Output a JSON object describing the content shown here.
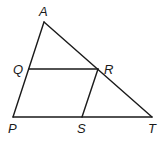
{
  "diagram": {
    "type": "geometry",
    "points": {
      "A": {
        "label": "A",
        "x": 44,
        "y": 22
      },
      "P": {
        "label": "P",
        "x": 13,
        "y": 117
      },
      "T": {
        "label": "T",
        "x": 152,
        "y": 117
      },
      "Q": {
        "label": "Q",
        "x": 29,
        "y": 69
      },
      "R": {
        "label": "R",
        "x": 98,
        "y": 69
      },
      "S": {
        "label": "S",
        "x": 82,
        "y": 117
      }
    },
    "segments": [
      [
        "A",
        "P"
      ],
      [
        "A",
        "T"
      ],
      [
        "P",
        "T"
      ],
      [
        "Q",
        "R"
      ],
      [
        "R",
        "S"
      ]
    ],
    "line_color": "#1a1a1a"
  }
}
